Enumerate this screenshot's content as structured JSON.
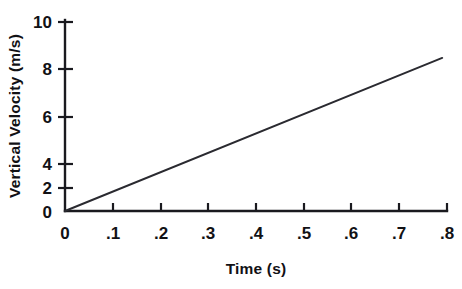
{
  "chart_data": {
    "type": "line",
    "title": "",
    "xlabel": "Time (s)",
    "ylabel": "Vertical Velocity (m/s)",
    "xlim": [
      0,
      0.8
    ],
    "ylim": [
      0,
      10
    ],
    "grid": false,
    "legend": false,
    "x_ticks": [
      0,
      0.1,
      0.2,
      0.3,
      0.4,
      0.5,
      0.6,
      0.7,
      0.8
    ],
    "x_tick_labels": [
      "0",
      ".1",
      ".2",
      ".3",
      ".4",
      ".5",
      ".6",
      ".7",
      ".8"
    ],
    "y_ticks": [
      0,
      2,
      4,
      6,
      8,
      10
    ],
    "y_tick_labels": [
      "0",
      "2",
      "4",
      "6",
      "8",
      "10"
    ],
    "series": [
      {
        "name": "vertical velocity",
        "color": "#2a2a30",
        "x": [
          0,
          0.79
        ],
        "y": [
          0,
          8.1
        ],
        "slope": 10.25,
        "intercept": 0
      }
    ]
  },
  "axes": {
    "x_axis_label": "Time (s)",
    "y_axis_label": "Vertical Velocity (m/s)",
    "axis_color": "#1a1a1f"
  }
}
